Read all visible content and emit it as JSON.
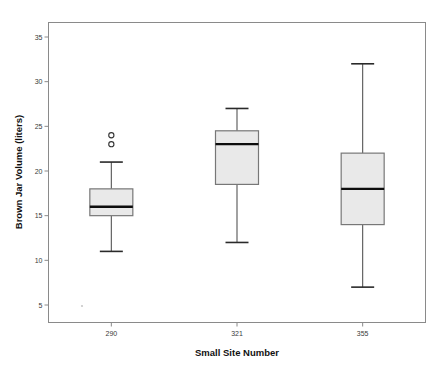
{
  "chart_data": {
    "type": "box",
    "title": "",
    "xlabel": "Small Site Number",
    "ylabel": "Brown Jar Volume (liters)",
    "categories": [
      "290",
      "321",
      "355"
    ],
    "ylim": [
      2.5,
      37
    ],
    "yticks": [
      5,
      10,
      15,
      20,
      25,
      30,
      35
    ],
    "ytick_labels": [
      "5",
      "10",
      "15",
      "20",
      "25",
      "30",
      "35"
    ],
    "grid": false,
    "legend": null,
    "boxes": [
      {
        "category": "290",
        "whisker_low": 11,
        "q1": 15,
        "median": 16,
        "q3": 18,
        "whisker_high": 21,
        "outliers": [
          23,
          24
        ]
      },
      {
        "category": "321",
        "whisker_low": 12,
        "q1": 18.5,
        "median": 23,
        "q3": 24.5,
        "whisker_high": 27,
        "outliers": []
      },
      {
        "category": "355",
        "whisker_low": 7,
        "q1": 14,
        "median": 18,
        "q3": 22,
        "whisker_high": 32,
        "outliers": []
      }
    ],
    "colors": {
      "box_fill": "#e9e9e9",
      "box_stroke": "#777777",
      "median": "#0d0d0d",
      "whisker": "#555555",
      "outlier": "#333333",
      "frame": "#8a8a8a",
      "text": "#111111",
      "background": "#ffffff"
    }
  }
}
